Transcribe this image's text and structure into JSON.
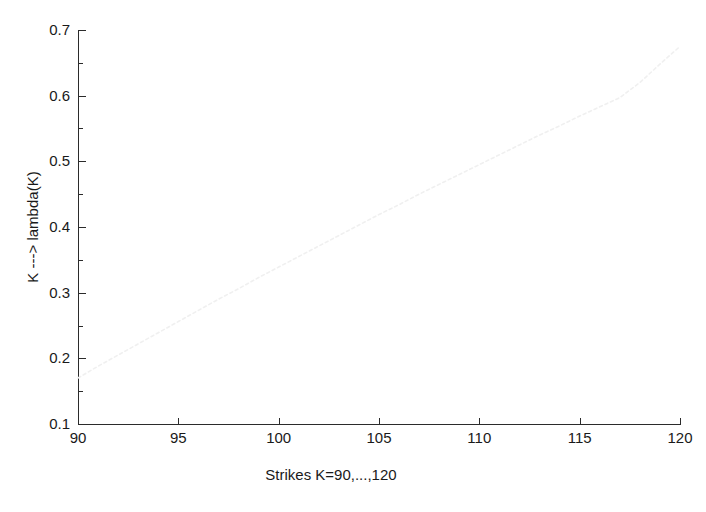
{
  "figure": {
    "background_color": "#ffffff",
    "axis_color": "#2b2b2b",
    "text_color": "#1a1a1a"
  },
  "chart_data": {
    "type": "line",
    "title": "",
    "subtitle": "",
    "xlabel": "Strikes K=90,...,120",
    "ylabel": "K ---> lambda(K)",
    "xlim": [
      90,
      120
    ],
    "ylim": [
      0.1,
      0.7
    ],
    "xticks": [
      90,
      95,
      100,
      105,
      110,
      115,
      120
    ],
    "xtick_labels": [
      "90",
      "95",
      "100",
      "105",
      "110",
      "115",
      "120"
    ],
    "yticks": [
      0.1,
      0.2,
      0.3,
      0.4,
      0.5,
      0.6,
      0.7
    ],
    "ytick_labels": [
      "0.1",
      "0.2",
      "0.3",
      "0.4",
      "0.5",
      "0.6",
      "0.7"
    ],
    "yticks_minor": [
      0.15,
      0.25,
      0.35,
      0.45,
      0.55,
      0.65
    ],
    "grid": false,
    "legend": null,
    "legend_position": "none",
    "annotations": [],
    "series": [
      {
        "name": "lambda(K)",
        "color": "#f0f0f0",
        "linestyle": "dotted",
        "linewidth": 1.6,
        "marker": "none",
        "x": [
          90,
          91,
          92,
          93,
          94,
          95,
          96,
          97,
          98,
          99,
          100,
          101,
          102,
          103,
          104,
          105,
          106,
          107,
          108,
          109,
          110,
          111,
          112,
          113,
          114,
          115,
          116,
          117,
          118,
          119,
          120
        ],
        "y": [
          0.17,
          0.188,
          0.205,
          0.222,
          0.239,
          0.256,
          0.273,
          0.29,
          0.306,
          0.323,
          0.339,
          0.355,
          0.371,
          0.387,
          0.403,
          0.419,
          0.434,
          0.45,
          0.465,
          0.48,
          0.495,
          0.51,
          0.525,
          0.54,
          0.554,
          0.569,
          0.583,
          0.597,
          0.62,
          0.648,
          0.675
        ]
      }
    ]
  },
  "icons": {
    "line_style_name": "dotted-line-icon"
  }
}
